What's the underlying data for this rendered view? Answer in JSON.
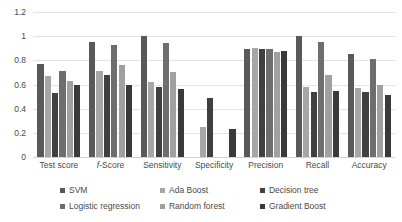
{
  "chart_data": {
    "type": "bar",
    "title": "",
    "xlabel": "",
    "ylabel": "",
    "ylim": [
      0,
      1.2
    ],
    "yticks": [
      "0",
      "0.2",
      "0.4",
      "0.6",
      "0.8",
      "1",
      "1.2"
    ],
    "ytick_values": [
      0,
      0.2,
      0.4,
      0.6,
      0.8,
      1,
      1.2
    ],
    "grid": true,
    "legend_position": "bottom",
    "categories": [
      "Test score",
      "f-Score",
      "Sensitivity",
      "Specificity",
      "Precision",
      "Recall",
      "Accuracy"
    ],
    "series": [
      {
        "name": "SVM",
        "color": "#595959",
        "values": [
          0.77,
          0.95,
          1.0,
          0.0,
          0.89,
          1.0,
          0.85
        ]
      },
      {
        "name": "Ada Boost",
        "color": "#a6a6a6",
        "values": [
          0.67,
          0.71,
          0.62,
          0.25,
          0.9,
          0.58,
          0.57
        ]
      },
      {
        "name": "Decision tree",
        "color": "#404040",
        "values": [
          0.53,
          0.68,
          0.58,
          0.49,
          0.89,
          0.54,
          0.54
        ]
      },
      {
        "name": "Logistic regression",
        "color": "#6e6e6e",
        "values": [
          0.71,
          0.93,
          0.94,
          0.0,
          0.89,
          0.95,
          0.81
        ]
      },
      {
        "name": "Random forest",
        "color": "#a0a0a0",
        "values": [
          0.63,
          0.76,
          0.7,
          0.0,
          0.87,
          0.68,
          0.6
        ]
      },
      {
        "name": "Gradient Boost",
        "color": "#3a3a3a",
        "values": [
          0.6,
          0.6,
          0.56,
          0.23,
          0.88,
          0.55,
          0.51
        ]
      }
    ]
  },
  "axis": {
    "y_ticks": [
      "1.2",
      "1",
      "0.8",
      "0.6",
      "0.4",
      "0.2",
      "0"
    ]
  },
  "legend": {
    "items": [
      {
        "label": "SVM"
      },
      {
        "label": "Ada Boost"
      },
      {
        "label": "Decision tree"
      },
      {
        "label": "Logistic regression"
      },
      {
        "label": "Random forest"
      },
      {
        "label": "Gradient Boost"
      }
    ]
  }
}
